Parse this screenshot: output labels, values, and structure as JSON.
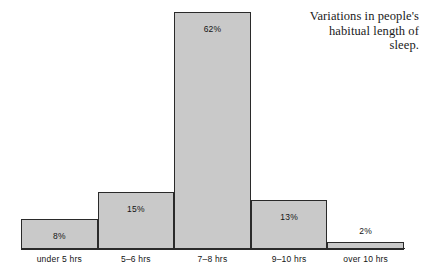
{
  "caption": {
    "lines": [
      "Variations in people's",
      "habitual length of",
      "sleep."
    ]
  },
  "chart_data": {
    "type": "bar",
    "title": "Variations in people's habitual length of sleep.",
    "xlabel": "",
    "ylabel": "",
    "ylim": [
      0,
      62
    ],
    "grid": false,
    "legend": null,
    "categories": [
      "under 5 hrs",
      "5–6 hrs",
      "7–8 hrs",
      "9–10 hrs",
      "over 10 hrs"
    ],
    "values": [
      8,
      15,
      62,
      13,
      2
    ],
    "value_labels": [
      "8%",
      "15%",
      "62%",
      "13%",
      "2%"
    ],
    "label_placement": [
      "inside",
      "inside",
      "inside",
      "inside",
      "above"
    ],
    "colors": {
      "bar_fill": "#c9c9c9",
      "bar_stroke": "#2a2a2a",
      "text": "#141414",
      "background": "#ffffff"
    }
  }
}
